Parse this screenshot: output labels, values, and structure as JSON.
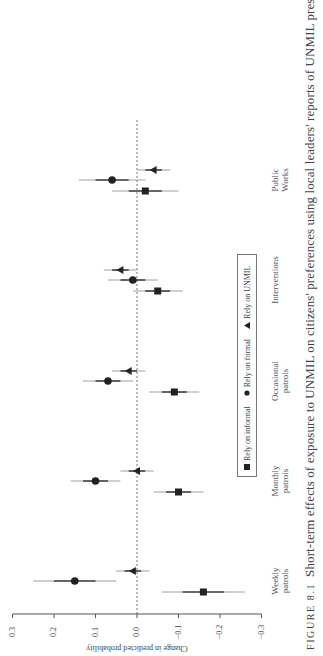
{
  "caption": {
    "figure_label": "FIGURE 8.1",
    "text": "Short-term effects of exposure to UNMIL on citizens' preferences using local leaders' reports of UNMIL presence"
  },
  "legend": {
    "items": [
      {
        "label": "Rely on informal",
        "marker": "square"
      },
      {
        "label": "Rely on formal",
        "marker": "circle"
      },
      {
        "label": "Rely on UNMIL",
        "marker": "triangle"
      }
    ]
  },
  "axis": {
    "label": "Change in predicted probability",
    "ticks": [
      "0.3",
      "0.2",
      "0.1",
      "0.0",
      "−0.1",
      "−0.2",
      "−0.3"
    ]
  },
  "categories": [
    {
      "label": "Weekly patrols",
      "line1": "Weekly",
      "line2": "patrols"
    },
    {
      "label": "Monthly patrols",
      "line1": "Monthly",
      "line2": "patrols"
    },
    {
      "label": "Occasional patrols",
      "line1": "Occasional",
      "line2": "patrols"
    },
    {
      "label": "Interventions",
      "line1": "Interventions",
      "line2": ""
    },
    {
      "label": "Public Works",
      "line1": "Public",
      "line2": "Works"
    }
  ],
  "chart_data": {
    "type": "scatter",
    "subtype": "coefficient-plot (point estimates with confidence intervals), rotated 90 degrees",
    "xlabel": "",
    "ylabel": "Change in predicted probability",
    "ylim": [
      -0.3,
      0.3
    ],
    "yticks": [
      0.3,
      0.2,
      0.1,
      0.0,
      -0.1,
      -0.2,
      -0.3
    ],
    "reference_line": {
      "value": 0.0,
      "style": "dashed"
    },
    "grid": false,
    "legend_position": "inside, boxed",
    "categories": [
      "Weekly patrols",
      "Monthly patrols",
      "Occasional patrols",
      "Interventions",
      "Public Works"
    ],
    "series": [
      {
        "name": "Rely on informal",
        "marker": "square",
        "values": [
          -0.16,
          -0.1,
          -0.09,
          -0.05,
          -0.02
        ],
        "ci_low": [
          -0.26,
          -0.16,
          -0.15,
          -0.11,
          -0.1
        ],
        "ci_high": [
          -0.06,
          -0.04,
          -0.03,
          0.01,
          0.06
        ]
      },
      {
        "name": "Rely on formal",
        "marker": "circle",
        "values": [
          0.15,
          0.1,
          0.07,
          0.01,
          0.06
        ],
        "ci_low": [
          0.05,
          0.04,
          0.01,
          -0.05,
          -0.02
        ],
        "ci_high": [
          0.25,
          0.16,
          0.13,
          0.07,
          0.14
        ]
      },
      {
        "name": "Rely on UNMIL",
        "marker": "triangle",
        "values": [
          0.01,
          0.0,
          0.02,
          0.04,
          -0.04
        ],
        "ci_low": [
          -0.03,
          -0.04,
          -0.02,
          0.0,
          -0.08
        ],
        "ci_high": [
          0.05,
          0.04,
          0.06,
          0.08,
          0.0
        ]
      }
    ]
  }
}
